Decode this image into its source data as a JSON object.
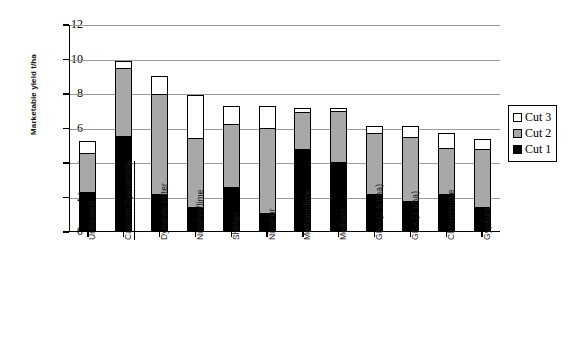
{
  "chart_data": {
    "type": "bar",
    "stacked": true,
    "title": "",
    "xlabel": "",
    "ylabel": "Marketable yield t/ha",
    "ylim": [
      0,
      12
    ],
    "yticks": [
      0,
      2,
      4,
      6,
      8,
      10,
      12
    ],
    "grid": true,
    "legend_position": "right",
    "categories": [
      "Untreated",
      "Calcium Cyanamide",
      "Dynamic Lifter",
      "Nitrabor/lime",
      "Shirlan",
      "Nitrabor",
      "Metham/lime",
      "Metham",
      "GBA (2.5 l/ha)",
      "GBA (1 t/ha)",
      "Clubrol/trace",
      "Gypsum"
    ],
    "series": [
      {
        "name": "Cut 1",
        "color": "#000000",
        "values": [
          2.3,
          5.55,
          2.2,
          1.45,
          2.6,
          1.1,
          4.8,
          4.05,
          2.2,
          1.8,
          2.2,
          1.45
        ]
      },
      {
        "name": "Cut 2",
        "color": "#a8a8a8",
        "values": [
          2.35,
          4.0,
          5.85,
          4.05,
          3.75,
          5.0,
          2.2,
          3.05,
          3.6,
          3.75,
          2.75,
          3.45
        ]
      },
      {
        "name": "Cut 3",
        "color": "#ffffff",
        "values": [
          0.75,
          0.5,
          1.1,
          2.55,
          1.1,
          1.35,
          0.35,
          0.2,
          0.5,
          0.7,
          0.95,
          0.6
        ]
      }
    ],
    "cumulative_tops": {
      "cut1": [
        2.3,
        5.55,
        2.2,
        1.45,
        2.6,
        1.1,
        4.8,
        4.05,
        2.2,
        1.8,
        2.2,
        1.45
      ],
      "cut2": [
        4.65,
        9.55,
        8.05,
        5.5,
        6.35,
        6.1,
        7.0,
        7.1,
        5.8,
        5.55,
        4.95,
        4.9
      ],
      "cut3": [
        5.4,
        10.05,
        9.15,
        8.05,
        7.45,
        7.45,
        7.35,
        7.3,
        6.3,
        6.25,
        5.9,
        5.5
      ]
    },
    "underlined_categories": [
      "Calcium Cyanamide"
    ]
  },
  "legend": {
    "items": [
      {
        "label": "Cut 3",
        "swatch": "c3"
      },
      {
        "label": "Cut 2",
        "swatch": "c2"
      },
      {
        "label": "Cut 1",
        "swatch": "c1"
      }
    ]
  }
}
